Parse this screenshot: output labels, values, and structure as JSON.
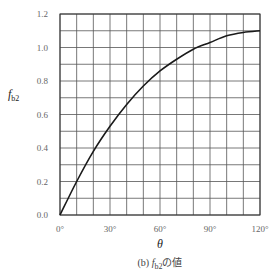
{
  "chart_data": {
    "type": "line",
    "title": "",
    "caption": {
      "prefix": "(b)",
      "symbol": "f",
      "subscript": "b2",
      "suffix": "の値"
    },
    "xlabel": "θ",
    "ylabel": {
      "symbol": "f",
      "subscript": "b2"
    },
    "xlim": [
      0,
      120
    ],
    "ylim": [
      0,
      1.2
    ],
    "grid": true,
    "x_minor_step": 10,
    "y_minor_step": 0.1,
    "x_ticks": [
      {
        "value": 0,
        "label": "0°"
      },
      {
        "value": 30,
        "label": "30°"
      },
      {
        "value": 60,
        "label": "60°"
      },
      {
        "value": 90,
        "label": "90°"
      },
      {
        "value": 120,
        "label": "120°"
      }
    ],
    "y_ticks": [
      {
        "value": 0.0,
        "label": "0.0"
      },
      {
        "value": 0.2,
        "label": "0.2"
      },
      {
        "value": 0.4,
        "label": "0.4"
      },
      {
        "value": 0.6,
        "label": "0.6"
      },
      {
        "value": 0.8,
        "label": "0.8"
      },
      {
        "value": 1.0,
        "label": "1.0"
      },
      {
        "value": 1.2,
        "label": "1.2"
      }
    ],
    "series": [
      {
        "name": "f_b2",
        "x": [
          0,
          10,
          20,
          30,
          40,
          50,
          60,
          70,
          80,
          90,
          100,
          110,
          120
        ],
        "values": [
          0.0,
          0.2,
          0.38,
          0.53,
          0.66,
          0.77,
          0.86,
          0.93,
          0.99,
          1.03,
          1.07,
          1.09,
          1.1
        ]
      }
    ],
    "legend": null
  },
  "colors": {
    "grid": "#555555",
    "curve": "#1a1a1a",
    "text": "#555555"
  }
}
